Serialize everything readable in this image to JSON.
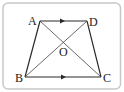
{
  "figure": {
    "type": "trapezoid-with-diagonals",
    "frame_color": "#c8c8c8",
    "line_color": "#2a2a2a",
    "points": {
      "A": {
        "label": "A",
        "x": 40,
        "y": 21
      },
      "D": {
        "label": "D",
        "x": 87,
        "y": 21
      },
      "B": {
        "label": "B",
        "x": 25,
        "y": 77
      },
      "C": {
        "label": "C",
        "x": 101,
        "y": 77
      },
      "O": {
        "label": "O",
        "x": 63,
        "y": 42
      }
    },
    "segments": [
      "AD",
      "DC",
      "CB",
      "BA",
      "AC",
      "BD"
    ],
    "parallel_marks": [
      "AD",
      "BC"
    ]
  }
}
